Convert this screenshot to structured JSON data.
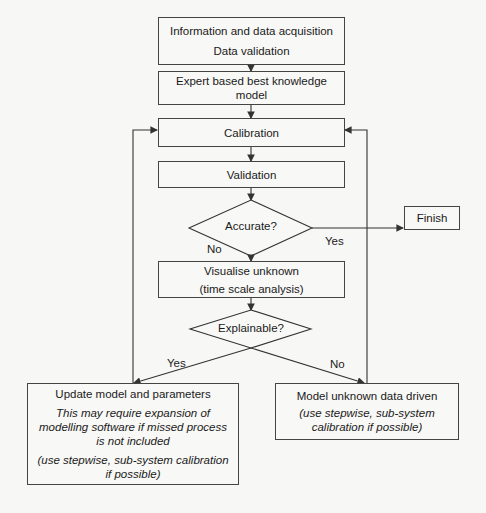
{
  "diagram": {
    "nodes": {
      "acquisition": {
        "line1": "Information and data acquisition",
        "line2": "Data validation"
      },
      "expert_model": {
        "line1": "Expert based best knowledge",
        "line2": "model"
      },
      "calibration": {
        "label": "Calibration"
      },
      "validation": {
        "label": "Validation"
      },
      "accurate": {
        "label": "Accurate?"
      },
      "finish": {
        "label": "Finish"
      },
      "visualise": {
        "line1": "Visualise unknown",
        "line2": "(time scale analysis)"
      },
      "explainable": {
        "label": "Explainable?"
      },
      "update_model": {
        "title": "Update model and parameters",
        "note1": "This may require expansion of modelling software if missed process is not included",
        "note2": "(use stepwise, sub-system calibration if possible)"
      },
      "model_unknown": {
        "title": "Model unknown data driven",
        "note": "(use stepwise, sub-system calibration if possible)"
      }
    },
    "edge_labels": {
      "accurate_yes": "Yes",
      "accurate_no": "No",
      "explainable_yes": "Yes",
      "explainable_no": "No"
    },
    "colors": {
      "stroke": "#444444",
      "fill": "#f8f8f6",
      "background": "#f7f7f5"
    }
  }
}
